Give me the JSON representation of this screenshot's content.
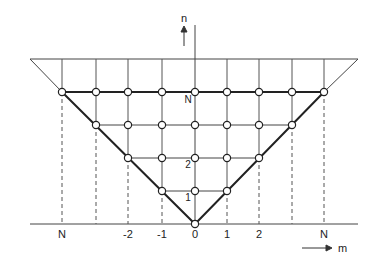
{
  "diagram": {
    "title": "",
    "axes": {
      "vertical_label": "n",
      "horizontal_label": "m"
    },
    "m_labels": [
      {
        "x": 62,
        "text": "N"
      },
      {
        "x": 128,
        "text": "-2"
      },
      {
        "x": 162,
        "text": "-1"
      },
      {
        "x": 195,
        "text": "0"
      },
      {
        "x": 227,
        "text": "1"
      },
      {
        "x": 259,
        "text": "2"
      },
      {
        "x": 324,
        "text": "N"
      }
    ],
    "n_labels": [
      {
        "y": 103,
        "text": "N"
      },
      {
        "y": 168,
        "text": "2"
      },
      {
        "y": 201,
        "text": "1"
      }
    ],
    "columns_x": [
      62,
      96,
      128,
      162,
      195,
      227,
      259,
      292,
      324
    ],
    "rows": [
      {
        "n": 0,
        "y": 224,
        "nodes_m": [
          0
        ]
      },
      {
        "n": 1,
        "y": 191,
        "nodes_m": [
          -1,
          0,
          1
        ]
      },
      {
        "n": 2,
        "y": 158,
        "nodes_m": [
          -2,
          -1,
          0,
          1,
          2
        ]
      },
      {
        "n": 3,
        "y": 125,
        "nodes_m": [
          -3,
          -2,
          -1,
          0,
          1,
          2,
          3
        ]
      },
      {
        "n": 4,
        "y": 92,
        "nodes_m": [
          -4,
          -3,
          -2,
          -1,
          0,
          1,
          2,
          3,
          4
        ]
      }
    ],
    "colors": {
      "line": "#333333",
      "node_fill": "#ffffff"
    }
  }
}
